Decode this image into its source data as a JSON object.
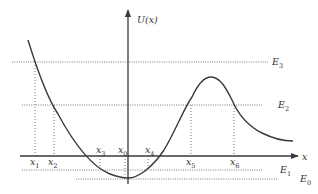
{
  "axes": {
    "y_label": "U(x)",
    "x_label": "x"
  },
  "energy_levels": [
    {
      "name": "E3",
      "base": "E",
      "sub": "3"
    },
    {
      "name": "E2",
      "base": "E",
      "sub": "2"
    },
    {
      "name": "E1",
      "base": "E",
      "sub": "1"
    },
    {
      "name": "E0",
      "base": "E",
      "sub": "0"
    }
  ],
  "turning_points": [
    {
      "name": "x1",
      "base": "x",
      "sub": "1"
    },
    {
      "name": "x2",
      "base": "x",
      "sub": "2"
    },
    {
      "name": "x3",
      "base": "x",
      "sub": "3"
    },
    {
      "name": "x0",
      "base": "x",
      "sub": "0"
    },
    {
      "name": "x4",
      "base": "x",
      "sub": "4"
    },
    {
      "name": "x5",
      "base": "x",
      "sub": "5"
    },
    {
      "name": "x6",
      "base": "x",
      "sub": "6"
    }
  ],
  "colors": {
    "curve": "#3a3a3a",
    "axis": "#3a3a3a",
    "dotted": "#6a6a6a",
    "text": "#333333"
  }
}
